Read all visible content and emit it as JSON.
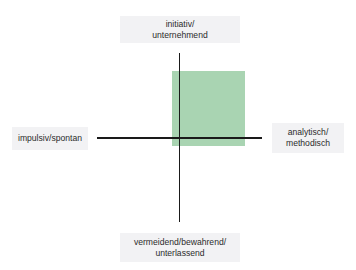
{
  "diagram": {
    "type": "quadrant-axis",
    "axes": {
      "top": {
        "line1": "initiativ/",
        "line2": "unternehmend"
      },
      "bottom": {
        "line1": "vermeidend/bewahrend/",
        "line2": "unterlassend"
      },
      "left": {
        "line1": "impulsiv/spontan"
      },
      "right": {
        "line1": "analytisch/",
        "line2": "methodisch"
      }
    },
    "highlight_area": {
      "quadrant": "upper-right",
      "color": "#a9d4b2"
    },
    "colors": {
      "axis": "#1a1a1a",
      "label_background": "#f2f2f4",
      "text": "#2b2b2b"
    }
  }
}
